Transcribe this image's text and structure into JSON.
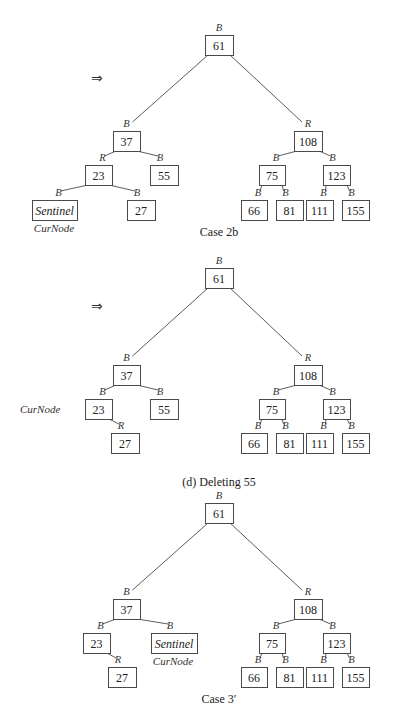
{
  "figure": {
    "panels": [
      {
        "id": "case-2b",
        "caption": "Case 2b",
        "show_arrow": true,
        "arrow_glyph": "⇒",
        "curnode_label": "CurNode",
        "curnode_attached_to": "sentinel",
        "nodes": [
          {
            "key": "n61",
            "label": "61",
            "color": "B"
          },
          {
            "key": "n37",
            "label": "37",
            "color": "B"
          },
          {
            "key": "n108",
            "label": "108",
            "color": "R"
          },
          {
            "key": "n23",
            "label": "23",
            "color": "R"
          },
          {
            "key": "n55",
            "label": "55",
            "color": "B"
          },
          {
            "key": "n75",
            "label": "75",
            "color": "B"
          },
          {
            "key": "n123",
            "label": "123",
            "color": "B"
          },
          {
            "key": "sentinel",
            "label": "Sentinel",
            "color": "B",
            "italic": true
          },
          {
            "key": "n27",
            "label": "27",
            "color": "B"
          },
          {
            "key": "n66",
            "label": "66",
            "color": "B"
          },
          {
            "key": "n81",
            "label": "81",
            "color": "B"
          },
          {
            "key": "n111",
            "label": "111",
            "color": "B"
          },
          {
            "key": "n155",
            "label": "155",
            "color": "B"
          }
        ],
        "edges": [
          [
            "n61",
            "n37"
          ],
          [
            "n61",
            "n108"
          ],
          [
            "n37",
            "n23"
          ],
          [
            "n37",
            "n55"
          ],
          [
            "n108",
            "n75"
          ],
          [
            "n108",
            "n123"
          ],
          [
            "n23",
            "sentinel"
          ],
          [
            "n23",
            "n27"
          ],
          [
            "n75",
            "n66"
          ],
          [
            "n75",
            "n81"
          ],
          [
            "n123",
            "n111"
          ],
          [
            "n123",
            "n155"
          ]
        ]
      },
      {
        "id": "after-case-2b",
        "caption": "(d) Deleting 55",
        "show_arrow": true,
        "arrow_glyph": "⇒",
        "curnode_label": "CurNode",
        "curnode_attached_to": "free-left-of-n23",
        "nodes": [
          {
            "key": "n61",
            "label": "61",
            "color": "B"
          },
          {
            "key": "n37",
            "label": "37",
            "color": "B"
          },
          {
            "key": "n108",
            "label": "108",
            "color": "R"
          },
          {
            "key": "n23",
            "label": "23",
            "color": "B"
          },
          {
            "key": "n55",
            "label": "55",
            "color": "B"
          },
          {
            "key": "n75",
            "label": "75",
            "color": "B"
          },
          {
            "key": "n123",
            "label": "123",
            "color": "B"
          },
          {
            "key": "n27",
            "label": "27",
            "color": "R"
          },
          {
            "key": "n66",
            "label": "66",
            "color": "B"
          },
          {
            "key": "n81",
            "label": "81",
            "color": "B"
          },
          {
            "key": "n111",
            "label": "111",
            "color": "B"
          },
          {
            "key": "n155",
            "label": "155",
            "color": "B"
          }
        ],
        "edges": [
          [
            "n61",
            "n37"
          ],
          [
            "n61",
            "n108"
          ],
          [
            "n37",
            "n23"
          ],
          [
            "n37",
            "n55"
          ],
          [
            "n108",
            "n75"
          ],
          [
            "n108",
            "n123"
          ],
          [
            "n23",
            "n27"
          ],
          [
            "n75",
            "n66"
          ],
          [
            "n75",
            "n81"
          ],
          [
            "n123",
            "n111"
          ],
          [
            "n123",
            "n155"
          ]
        ]
      },
      {
        "id": "case-3-prime",
        "caption": "Case 3′",
        "show_arrow": false,
        "curnode_label": "CurNode",
        "curnode_attached_to": "sentinel",
        "nodes": [
          {
            "key": "n61",
            "label": "61",
            "color": "B"
          },
          {
            "key": "n37",
            "label": "37",
            "color": "B"
          },
          {
            "key": "n108",
            "label": "108",
            "color": "R"
          },
          {
            "key": "n23",
            "label": "23",
            "color": "B"
          },
          {
            "key": "sentinel",
            "label": "Sentinel",
            "color": "B",
            "italic": true
          },
          {
            "key": "n75",
            "label": "75",
            "color": "B"
          },
          {
            "key": "n123",
            "label": "123",
            "color": "B"
          },
          {
            "key": "n27",
            "label": "27",
            "color": "R"
          },
          {
            "key": "n66",
            "label": "66",
            "color": "B"
          },
          {
            "key": "n81",
            "label": "81",
            "color": "B"
          },
          {
            "key": "n111",
            "label": "111",
            "color": "B"
          },
          {
            "key": "n155",
            "label": "155",
            "color": "B"
          }
        ],
        "edges": [
          [
            "n61",
            "n37"
          ],
          [
            "n61",
            "n108"
          ],
          [
            "n37",
            "n23"
          ],
          [
            "n37",
            "sentinel"
          ],
          [
            "n108",
            "n75"
          ],
          [
            "n108",
            "n123"
          ],
          [
            "n23",
            "n27"
          ],
          [
            "n75",
            "n66"
          ],
          [
            "n75",
            "n81"
          ],
          [
            "n123",
            "n111"
          ],
          [
            "n123",
            "n155"
          ]
        ]
      }
    ]
  }
}
